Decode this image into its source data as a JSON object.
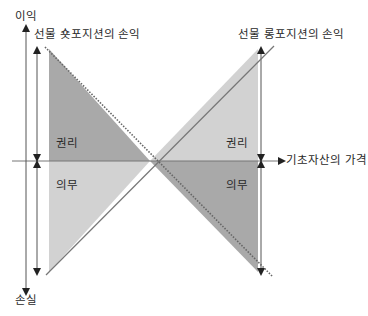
{
  "labels": {
    "y_top": "이익",
    "y_bottom": "손실",
    "x_axis": "기초자산의 가격",
    "short_title": "선물 숏포지션의 손익",
    "long_title": "선물 롱포지션의 손익",
    "left_right": "권리",
    "left_obligation": "의무",
    "right_right": "권리",
    "right_obligation": "의무"
  },
  "colors": {
    "dark_shade": "#a9a9a9",
    "light_shade": "#d2d2d2",
    "line": "#555555",
    "axis": "#666666"
  }
}
